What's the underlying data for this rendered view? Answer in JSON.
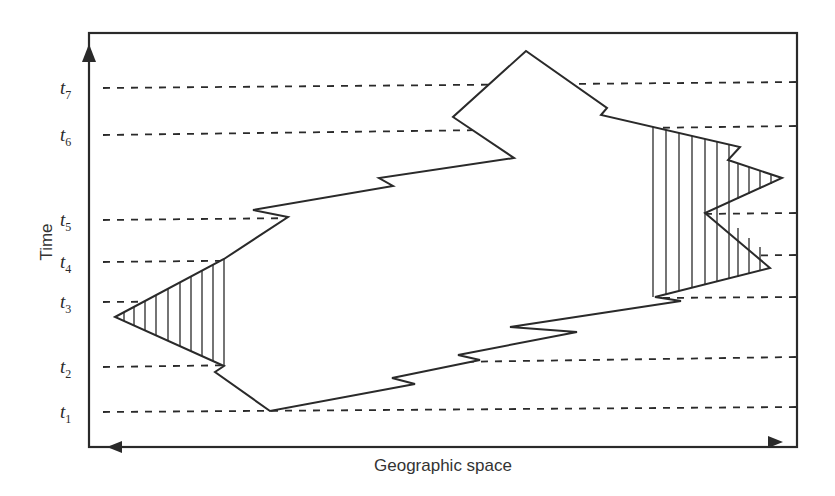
{
  "diagram": {
    "title": "",
    "y_axis_label": "Time",
    "x_axis_label": "Geographic space",
    "time_levels": [
      {
        "label": "t",
        "sub": "7",
        "y": 88
      },
      {
        "label": "t",
        "sub": "6",
        "y": 135
      },
      {
        "label": "t",
        "sub": "5",
        "y": 220
      },
      {
        "label": "t",
        "sub": "4",
        "y": 262
      },
      {
        "label": "t",
        "sub": "3",
        "y": 302
      },
      {
        "label": "t",
        "sub": "2",
        "y": 367
      },
      {
        "label": "t",
        "sub": "1",
        "y": 412
      }
    ],
    "shapes": {
      "main_region": "space-time polygon",
      "left_hatched_region": "hatched triangle (left)",
      "right_hatched_region": "hatched area (right)"
    },
    "colors": {
      "line": "#2a2a2a",
      "background": "#ffffff"
    }
  }
}
